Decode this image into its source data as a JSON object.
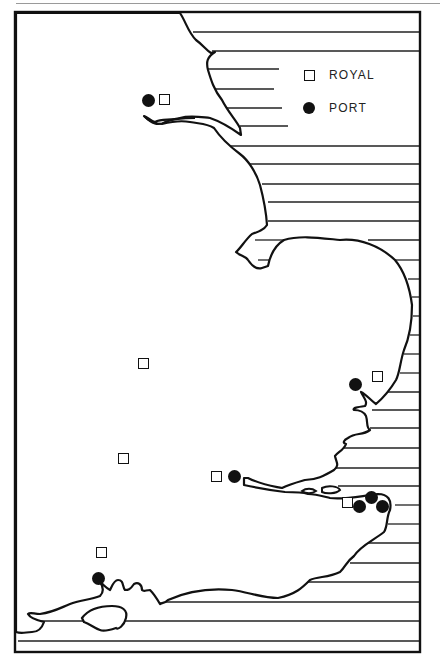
{
  "map": {
    "title": "",
    "region": "England (north-east to south coast)",
    "frame": {
      "left": 15,
      "top": 12,
      "right": 420,
      "bottom": 652
    },
    "sea_hatching": "horizontal lines",
    "colors": {
      "ink": "#111111",
      "land": "#ffffff",
      "sea_lines": "#222222"
    }
  },
  "legend": {
    "items": [
      {
        "symbol": "hollow-square",
        "label": "ROYAL"
      },
      {
        "symbol": "filled-circle",
        "label": "PORT"
      }
    ]
  },
  "markers": [
    {
      "type": "port",
      "x": 148,
      "y": 100
    },
    {
      "type": "royal",
      "x": 165,
      "y": 100
    },
    {
      "type": "royal",
      "x": 144,
      "y": 364
    },
    {
      "type": "port",
      "x": 355,
      "y": 384
    },
    {
      "type": "royal",
      "x": 378,
      "y": 377
    },
    {
      "type": "royal",
      "x": 124,
      "y": 459
    },
    {
      "type": "royal",
      "x": 217,
      "y": 477
    },
    {
      "type": "port",
      "x": 234,
      "y": 476
    },
    {
      "type": "royal",
      "x": 348,
      "y": 503
    },
    {
      "type": "port",
      "x": 371,
      "y": 497
    },
    {
      "type": "port",
      "x": 359,
      "y": 506
    },
    {
      "type": "port",
      "x": 382,
      "y": 506
    },
    {
      "type": "royal",
      "x": 102,
      "y": 553
    },
    {
      "type": "port",
      "x": 98,
      "y": 578
    }
  ]
}
